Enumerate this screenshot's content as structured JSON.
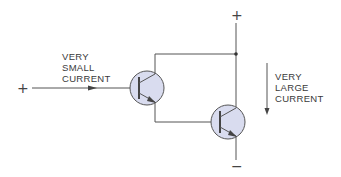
{
  "diagram": {
    "input": {
      "terminal_label": "+",
      "current_label_lines": [
        "VERY",
        "SMALL",
        "CURRENT"
      ]
    },
    "supply": {
      "top_terminal_label": "+",
      "bottom_terminal_label": "−"
    },
    "output": {
      "current_label_lines": [
        "VERY",
        "LARGE",
        "CURRENT"
      ]
    },
    "components": [
      {
        "id": "T1",
        "type": "npn-transistor",
        "role": "driver"
      },
      {
        "id": "T2",
        "type": "npn-transistor",
        "role": "output"
      }
    ],
    "colors": {
      "wire": "#555555",
      "transistor_fill": "#d9dcef",
      "transistor_stroke": "#555555",
      "text": "#3a3a3a"
    }
  }
}
